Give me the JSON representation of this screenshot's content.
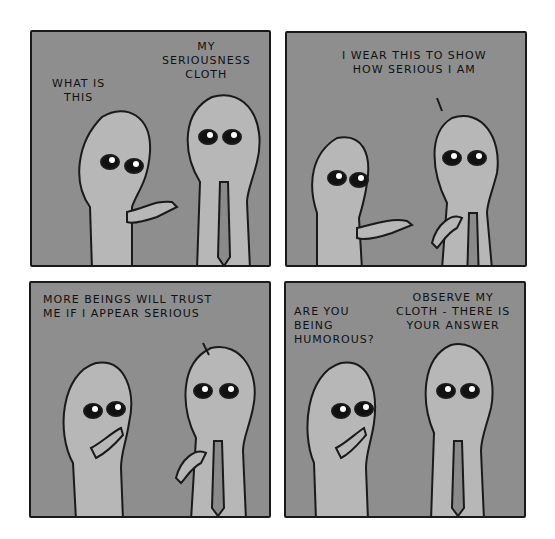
{
  "comic": {
    "colors": {
      "background": "#ffffff",
      "panel_fill": "#8e8e8e",
      "alien_body": "#b7b7b7",
      "outline": "#1a1a1a",
      "tie": "#8a8a8a"
    },
    "panels": [
      {
        "id": 1,
        "captions": [
          {
            "speaker": "short-alien",
            "text": "WHAT IS\nTHIS"
          },
          {
            "speaker": "tall-alien",
            "text": "MY\nSERIOUSNESS\nCLOTH"
          }
        ]
      },
      {
        "id": 2,
        "captions": [
          {
            "speaker": "tall-alien",
            "text": "I WEAR THIS TO SHOW\nHOW SERIOUS I AM"
          }
        ]
      },
      {
        "id": 3,
        "captions": [
          {
            "speaker": "tall-alien",
            "text": "MORE BEINGS WILL TRUST\nME IF I APPEAR SERIOUS"
          }
        ]
      },
      {
        "id": 4,
        "captions": [
          {
            "speaker": "short-alien",
            "text": "ARE YOU\nBEING\nHUMOROUS?"
          },
          {
            "speaker": "tall-alien",
            "text": "OBSERVE MY\nCLOTH - THERE IS\nYOUR ANSWER"
          }
        ]
      }
    ]
  }
}
